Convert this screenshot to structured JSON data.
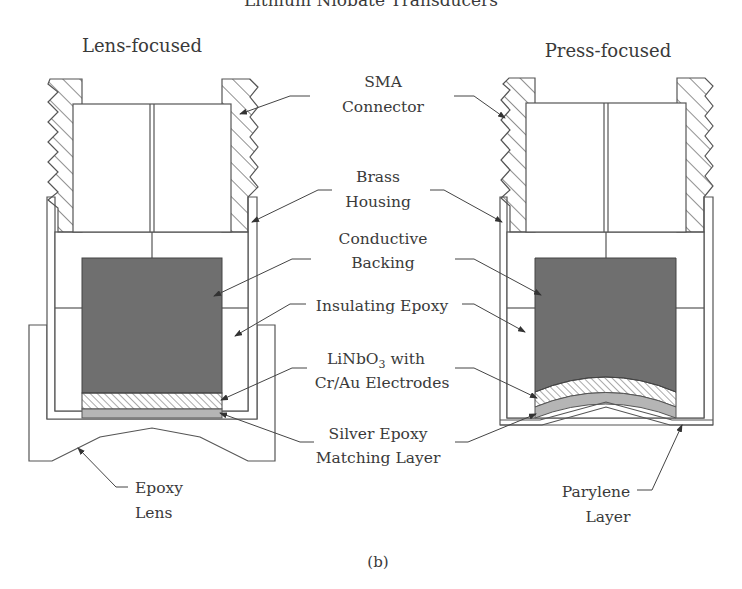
{
  "figure": {
    "header_partial": "Lithium Niobate Transducers",
    "caption": "(b)",
    "left_title": "Lens-focused",
    "right_title": "Press-focused"
  },
  "labels": {
    "sma_1": "SMA",
    "sma_2": "Connector",
    "brass_1": "Brass",
    "brass_2": "Housing",
    "backing_1": "Conductive",
    "backing_2": "Backing",
    "insulating": "Insulating Epoxy",
    "linbo3_1a": "LiNbO",
    "linbo3_1sub": "3",
    "linbo3_1b": " with",
    "linbo3_2": "Cr/Au Electrodes",
    "silver_1": "Silver Epoxy",
    "silver_2": "Matching Layer",
    "lens_1": "Epoxy",
    "lens_2": "Lens",
    "parylene_1": "Parylene",
    "parylene_2": "Layer"
  },
  "colors": {
    "line": "#555555",
    "backing_fill": "#6f6f6f",
    "silver_fill": "#b5b5b5",
    "background": "#ffffff"
  }
}
